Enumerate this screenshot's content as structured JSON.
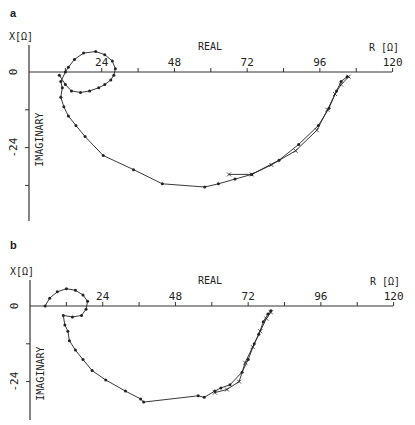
{
  "figure": {
    "panels": [
      {
        "letter": "a"
      },
      {
        "letter": "b"
      }
    ],
    "colors": {
      "line": "#222222",
      "axis": "#333333",
      "background": "#ffffff"
    }
  },
  "chart_data": [
    {
      "panel": "a",
      "type": "line",
      "title": "",
      "xlabel": "REAL",
      "x_unit_label": "R [Ω]",
      "ylabel": "IMAGINARY",
      "y_unit_label": "X[Ω]",
      "x_ticks": [
        24,
        48,
        72,
        96,
        120
      ],
      "y_ticks": [
        0,
        -24
      ],
      "xlim": [
        0,
        120
      ],
      "ylim": [
        -48,
        10
      ],
      "grid": false,
      "legend": null,
      "series": [
        {
          "name": "trace-1 (filled markers)",
          "marker": "dot",
          "points": [
            [
              10,
              -1
            ],
            [
              12,
              -4
            ],
            [
              14,
              -6
            ],
            [
              17,
              -6.5
            ],
            [
              20,
              -6
            ],
            [
              23,
              -5
            ],
            [
              25,
              -4
            ],
            [
              27,
              -2.5
            ],
            [
              28,
              -1
            ],
            [
              28.5,
              1
            ],
            [
              27.5,
              3.5
            ],
            [
              25,
              5.5
            ],
            [
              22,
              6.5
            ],
            [
              18,
              6
            ],
            [
              15,
              4
            ],
            [
              13,
              1.5
            ],
            [
              12,
              0
            ],
            [
              10.5,
              -3
            ],
            [
              11,
              -5
            ],
            [
              10.5,
              -8
            ],
            [
              11.5,
              -11
            ],
            [
              13,
              -14
            ],
            [
              15.5,
              -17
            ],
            [
              18.5,
              -20.5
            ],
            [
              24.5,
              -26.5
            ],
            [
              34.5,
              -31
            ],
            [
              44,
              -35.5
            ],
            [
              58,
              -36.5
            ],
            [
              62.5,
              -35.5
            ],
            [
              68,
              -34
            ],
            [
              73.5,
              -32.5
            ],
            [
              82.5,
              -28
            ],
            [
              89,
              -23
            ],
            [
              95.5,
              -17
            ],
            [
              99,
              -11.5
            ],
            [
              101.5,
              -6
            ],
            [
              103,
              -3
            ],
            [
              105,
              -1.5
            ]
          ]
        },
        {
          "name": "trace-2 (x markers)",
          "marker": "x",
          "points": [
            [
              66,
              -32.5
            ],
            [
              73.5,
              -32.5
            ],
            [
              80,
              -29.5
            ],
            [
              88,
              -25
            ],
            [
              95,
              -18.5
            ],
            [
              98.5,
              -12
            ],
            [
              101,
              -7
            ],
            [
              103,
              -4
            ],
            [
              105.5,
              -1.5
            ]
          ]
        }
      ]
    },
    {
      "panel": "b",
      "type": "line",
      "title": "",
      "xlabel": "REAL",
      "x_unit_label": "R [Ω]",
      "ylabel": "IMAGINARY",
      "y_unit_label": "X[Ω]",
      "x_ticks": [
        24,
        48,
        72,
        96,
        120
      ],
      "y_ticks": [
        0,
        -24
      ],
      "xlim": [
        0,
        120
      ],
      "ylim": [
        -36,
        10
      ],
      "grid": false,
      "legend": null,
      "series": [
        {
          "name": "trace-1 (filled markers)",
          "marker": "dot",
          "points": [
            [
              5,
              0
            ],
            [
              6.5,
              2.5
            ],
            [
              9,
              4.5
            ],
            [
              12,
              5.5
            ],
            [
              15,
              5
            ],
            [
              17.5,
              3.5
            ],
            [
              19,
              1.5
            ],
            [
              18.5,
              -1
            ],
            [
              17,
              -3
            ],
            [
              14,
              -3.5
            ],
            [
              11,
              -3
            ],
            [
              11.5,
              -6
            ],
            [
              12.5,
              -8
            ],
            [
              13,
              -11
            ],
            [
              15,
              -14
            ],
            [
              17.5,
              -17
            ],
            [
              20.5,
              -20.5
            ],
            [
              25,
              -23.5
            ],
            [
              31.5,
              -27
            ],
            [
              36.5,
              -29.5
            ],
            [
              37.5,
              -30.5
            ],
            [
              55.5,
              -28.5
            ],
            [
              57.5,
              -29
            ],
            [
              61,
              -27
            ],
            [
              63,
              -26
            ],
            [
              66,
              -25
            ],
            [
              70,
              -21
            ],
            [
              72,
              -17
            ],
            [
              74,
              -12
            ],
            [
              75.5,
              -9
            ],
            [
              77,
              -5
            ],
            [
              78.5,
              -2.5
            ],
            [
              79.5,
              -1.5
            ]
          ]
        },
        {
          "name": "trace-2 (x markers)",
          "marker": "x",
          "points": [
            [
              61,
              -27.5
            ],
            [
              65,
              -26.5
            ],
            [
              69,
              -24
            ],
            [
              71,
              -18
            ],
            [
              73.5,
              -13
            ],
            [
              76,
              -8
            ],
            [
              78,
              -4
            ],
            [
              79.5,
              -2
            ]
          ]
        }
      ]
    }
  ]
}
